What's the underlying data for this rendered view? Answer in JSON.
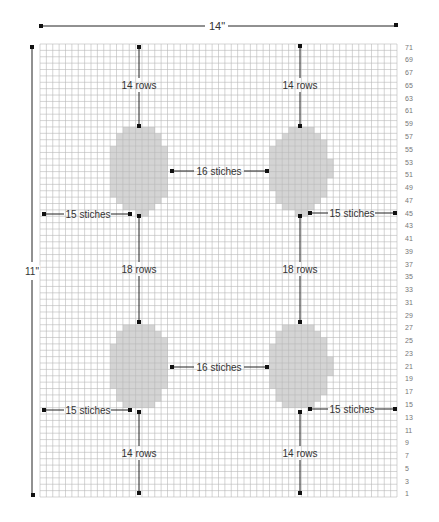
{
  "diagram": {
    "width_label": "14\"",
    "height_label": "11\"",
    "grid": {
      "columns": 56,
      "rows": 71,
      "left": 40,
      "top": 44,
      "right": 397,
      "bottom": 497,
      "line_color": "#b8b8b8",
      "bg_color": "#ffffff"
    },
    "row_numbers": [
      71,
      69,
      67,
      65,
      63,
      61,
      59,
      57,
      55,
      53,
      51,
      49,
      47,
      45,
      43,
      41,
      39,
      37,
      35,
      33,
      31,
      29,
      27,
      25,
      23,
      21,
      19,
      17,
      15,
      13,
      11,
      9,
      7,
      5,
      3,
      1
    ],
    "motif_color": "#d4d4d4",
    "line_color": "#222222",
    "motifs": [
      {
        "name": "oval-top-left",
        "cx": 139,
        "cy": 170,
        "rx": 31,
        "ry": 44
      },
      {
        "name": "oval-top-right",
        "cx": 300,
        "cy": 170,
        "rx": 31,
        "ry": 44
      },
      {
        "name": "oval-bottom-left",
        "cx": 139,
        "cy": 366,
        "rx": 31,
        "ry": 44
      },
      {
        "name": "oval-bottom-right",
        "cx": 300,
        "cy": 366,
        "rx": 31,
        "ry": 44
      }
    ],
    "annotations": {
      "top_left_rows": "14 rows",
      "top_right_rows": "14 rows",
      "middle_left_rows": "18 rows",
      "middle_right_rows": "18 rows",
      "bottom_left_rows": "14 rows",
      "bottom_right_rows": "14 rows",
      "top_between": "16 stiches",
      "bottom_between": "16 stiches",
      "upper_left_edge": "15 stiches",
      "upper_right_edge": "15 stiches",
      "lower_left_edge": "15 stiches",
      "lower_right_edge": "15 stiches"
    }
  }
}
